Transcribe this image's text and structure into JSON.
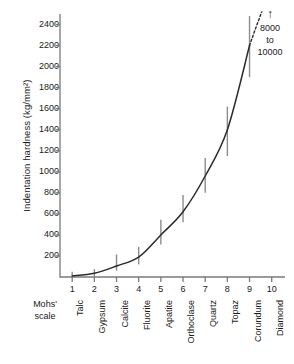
{
  "chart_data": {
    "type": "line",
    "title": "",
    "xlabel": "Mohs' scale",
    "ylabel": "Indentation hardness (kg/mm²)",
    "ylabel_plain": "Indentation hardness (kg/mm2)",
    "ylim": [
      0,
      2500
    ],
    "xlim": [
      0.45,
      10.6
    ],
    "grid": false,
    "legend": "none",
    "x": [
      1,
      2,
      3,
      4,
      5,
      6,
      7,
      8,
      9,
      10
    ],
    "categories": [
      "Talc",
      "Gypsum",
      "Calcite",
      "Fluorite",
      "Apatite",
      "Orthoclase",
      "Quartz",
      "Topaz",
      "Corundum",
      "Diamond"
    ],
    "xtick_labels": [
      "1",
      "2",
      "3",
      "4",
      "5",
      "6",
      "7",
      "8",
      "9",
      "10"
    ],
    "ytick_labels": [
      "200",
      "400",
      "600",
      "800",
      "1000",
      "1200",
      "1400",
      "1600",
      "1800",
      "2000",
      "2200",
      "2400"
    ],
    "ytick_values": [
      200,
      400,
      600,
      800,
      1000,
      1200,
      1400,
      1600,
      1800,
      2000,
      2200,
      2400
    ],
    "series": [
      {
        "name": "Indentation hardness",
        "style": "solid-curve",
        "values": [
          10,
          35,
          105,
          190,
          400,
          620,
          960,
          1400,
          2200,
          null
        ]
      }
    ],
    "error_bars": [
      {
        "mineral": "Talc",
        "x": 1,
        "low": 0,
        "high": 50
      },
      {
        "mineral": "Gypsum",
        "x": 2,
        "low": 0,
        "high": 75
      },
      {
        "mineral": "Calcite",
        "x": 3,
        "low": 60,
        "high": 215
      },
      {
        "mineral": "Fluorite",
        "x": 4,
        "low": 120,
        "high": 285
      },
      {
        "mineral": "Apatite",
        "x": 5,
        "low": 310,
        "high": 545
      },
      {
        "mineral": "Orthoclase",
        "x": 6,
        "low": 520,
        "high": 780
      },
      {
        "mineral": "Quartz",
        "x": 7,
        "low": 800,
        "high": 1130
      },
      {
        "mineral": "Topaz",
        "x": 8,
        "low": 1150,
        "high": 1620
      },
      {
        "mineral": "Corundum",
        "x": 9,
        "low": 1900,
        "high": 2480
      }
    ],
    "dashed_extension": {
      "from_x": 9.25,
      "from_y": 2350,
      "to_x": 9.55,
      "to_y": 2520,
      "note": "curve continues off-scale toward Diamond"
    },
    "annotations": [
      {
        "name": "diamond-hardness-note",
        "arrow": "↑",
        "lines": [
          "8000",
          "to",
          "10000"
        ],
        "text": "8000 to 10000"
      }
    ],
    "axis_label_left_lines": [
      "Mohs'",
      "scale"
    ],
    "colors": {
      "curve": "#2b2b2b",
      "axis": "#7a7a7a",
      "error_bar": "#8c8c8c",
      "text": "#1a1a1a",
      "background": "#ffffff"
    }
  }
}
